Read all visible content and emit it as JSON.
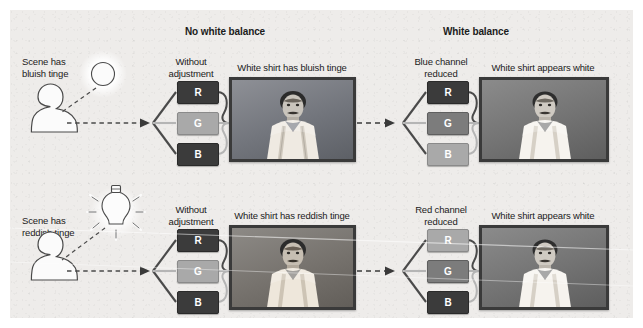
{
  "figure": {
    "headers": [
      {
        "label": "No white balance",
        "x": 185,
        "y": 26
      },
      {
        "label": "White balance",
        "x": 443,
        "y": 26
      }
    ],
    "rows": [
      {
        "id": "top-row",
        "scene_caption": "Scene has\nbluish tinge",
        "light_source_icon": "sun-icon",
        "left": {
          "adjust_caption": "Without\nadjustment",
          "photo_caption": "White shirt has bluish tinge",
          "channels": [
            {
              "letter": "R",
              "tone": "dark"
            },
            {
              "letter": "G",
              "tone": "light"
            },
            {
              "letter": "B",
              "tone": "dark"
            }
          ]
        },
        "right": {
          "adjust_caption": "Blue channel\nreduced",
          "photo_caption": "White shirt appears white",
          "channels": [
            {
              "letter": "R",
              "tone": "dark"
            },
            {
              "letter": "G",
              "tone": "mid"
            },
            {
              "letter": "B",
              "tone": "light"
            }
          ]
        }
      },
      {
        "id": "bottom-row",
        "scene_caption": "Scene has\nreddish tinge",
        "light_source_icon": "lightbulb-icon",
        "left": {
          "adjust_caption": "Without\nadjustment",
          "photo_caption": "White shirt has reddish tinge",
          "channels": [
            {
              "letter": "R",
              "tone": "dark"
            },
            {
              "letter": "G",
              "tone": "light"
            },
            {
              "letter": "B",
              "tone": "dark"
            }
          ]
        },
        "right": {
          "adjust_caption": "Red channel\nreduced",
          "photo_caption": "White shirt appears white",
          "channels": [
            {
              "letter": "R",
              "tone": "light"
            },
            {
              "letter": "G",
              "tone": "mid"
            },
            {
              "letter": "B",
              "tone": "dark"
            }
          ]
        }
      }
    ],
    "colors": {
      "panel_background": "#eeecea",
      "text": "#1b1b1b",
      "chip_dark": "#3b3b3b",
      "chip_mid": "#7c7c7c",
      "chip_light": "#a9a9a9",
      "wire_dark": "#4a4a4a",
      "wire_light": "#b5b5b5",
      "photo_border": "#3a3a3a"
    }
  }
}
